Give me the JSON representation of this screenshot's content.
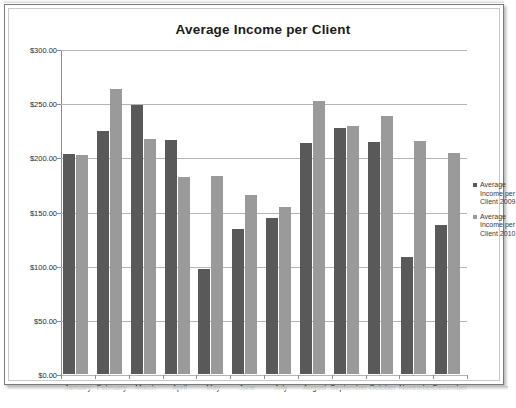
{
  "chart_data": {
    "type": "bar",
    "title": "Average Income per Client",
    "xlabel": "",
    "ylabel": "",
    "categories": [
      "January",
      "February",
      "March",
      "April",
      "May",
      "June",
      "July",
      "August",
      "September",
      "October",
      "November",
      "December"
    ],
    "series": [
      {
        "name": "Average Income per Client 2009",
        "color": "#595959",
        "values": [
          203,
          224,
          248,
          216,
          97,
          134,
          144,
          213,
          227,
          214,
          108,
          138
        ]
      },
      {
        "name": "Average Income per Client 2010",
        "color": "#9a9a9a",
        "values": [
          202,
          263,
          217,
          182,
          183,
          165,
          154,
          252,
          229,
          238,
          215,
          204
        ]
      }
    ],
    "ylim": [
      0,
      300
    ],
    "ytick_values": [
      0,
      50,
      100,
      150,
      200,
      250,
      300
    ],
    "ytick_labels": [
      "$0.00",
      "$50.00",
      "$100.00",
      "$150.00",
      "$200.00",
      "$250.00",
      "$300.00"
    ],
    "grid": true,
    "legend_position": "right",
    "value_prefix": "$"
  },
  "legend": {
    "entries": [
      {
        "label": "Average Income per Client 2009",
        "color": "#595959"
      },
      {
        "label": "Average Income per Client 2010",
        "color": "#9a9a9a"
      }
    ]
  }
}
